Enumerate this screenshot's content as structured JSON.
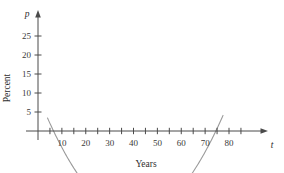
{
  "chart_data": {
    "type": "line",
    "title": "",
    "subtitle": "",
    "xlabel": "Years",
    "ylabel": "Percent",
    "x_axis_variable": "t",
    "y_axis_variable": "p",
    "xlim": [
      0,
      90
    ],
    "ylim": [
      -3,
      27
    ],
    "grid": false,
    "legend": false,
    "x_tick_labels": [
      "10",
      "20",
      "30",
      "40",
      "50",
      "60",
      "70",
      "80"
    ],
    "x_tick_values": [
      10,
      20,
      30,
      40,
      50,
      60,
      70,
      80
    ],
    "x_minor_tick_values": [
      5,
      10,
      15,
      20,
      25,
      30,
      35,
      40,
      45,
      50,
      55,
      60,
      65,
      70,
      75,
      80,
      85
    ],
    "y_tick_labels": [
      "5",
      "10",
      "15",
      "20",
      "25"
    ],
    "y_tick_values": [
      5,
      10,
      15,
      20,
      25
    ],
    "series": [
      {
        "name": "percent-curve",
        "color": "#9a9a9a",
        "shape": "downward-parabola",
        "roots": [
          6.5,
          74.5
        ],
        "vertex_x": 40.5,
        "vertex_y": 22.3,
        "x": [
          4.0,
          6.5,
          10,
          15,
          20,
          25,
          30,
          35,
          40.5,
          45,
          50,
          55,
          60,
          65,
          70,
          74.5,
          77.5
        ],
        "values": [
          -2.6,
          0.0,
          3.6,
          8.0,
          11.8,
          15.1,
          17.8,
          20.0,
          22.3,
          21.5,
          20.1,
          18.0,
          15.3,
          12.0,
          8.1,
          0.0,
          -3.0
        ]
      }
    ],
    "annotations": []
  },
  "figure": {
    "axis_color": "#4a4a4a",
    "curve_color": "#9a9a9a",
    "background": "#ffffff"
  }
}
